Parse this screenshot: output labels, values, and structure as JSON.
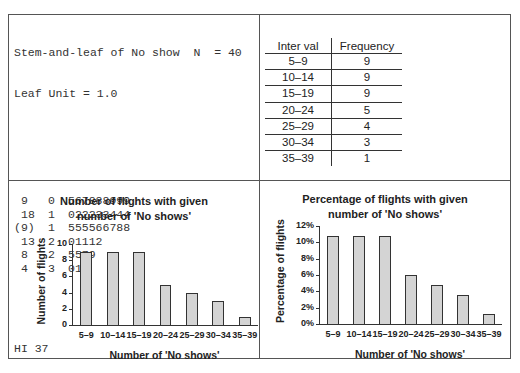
{
  "stem_and_leaf": {
    "header": "Stem-and-leaf of No show  N  = 40",
    "leaf_unit": "Leaf Unit = 1.0",
    "rows": [
      {
        "depth": "9",
        "stem": "0",
        "leaves": "567888999"
      },
      {
        "depth": "18",
        "stem": "1",
        "leaves": "022233444"
      },
      {
        "depth": "(9)",
        "stem": "1",
        "leaves": "555566788"
      },
      {
        "depth": "13",
        "stem": "2",
        "leaves": "01112"
      },
      {
        "depth": "8",
        "stem": "2",
        "leaves": "5579"
      },
      {
        "depth": "4",
        "stem": "3",
        "leaves": "014"
      }
    ],
    "hi": "HI 37"
  },
  "frequency_table": {
    "headers": [
      "Inter val",
      "Frequency"
    ],
    "rows": [
      [
        "5–9",
        "9"
      ],
      [
        "10–14",
        "9"
      ],
      [
        "15–19",
        "9"
      ],
      [
        "20–24",
        "5"
      ],
      [
        "25–29",
        "4"
      ],
      [
        "30–34",
        "3"
      ],
      [
        "35–39",
        "1"
      ]
    ]
  },
  "chart_data": [
    {
      "type": "bar",
      "title": "Number of flights with given number of 'No shows'",
      "title_lines": [
        "Number of flights with given",
        "number of 'No shows'"
      ],
      "categories": [
        "5–9",
        "10–14",
        "15–19",
        "20–24",
        "25–29",
        "30–34",
        "35–39"
      ],
      "values": [
        9,
        9,
        9,
        5,
        4,
        3,
        1
      ],
      "xlabel": "Number of 'No shows'",
      "ylabel": "Number of flights",
      "ylim": [
        0,
        10
      ],
      "yticks": [
        "0",
        "2",
        "4",
        "6",
        "8",
        "10"
      ],
      "grid": false,
      "bar_color": "#d4d4d4"
    },
    {
      "type": "bar",
      "title": "Percentage of flights with given number of 'No shows'",
      "title_lines": [
        "Percentage of flights with given",
        "number of 'No shows'"
      ],
      "categories": [
        "5–9",
        "10–14",
        "15–19",
        "20–24",
        "25–29",
        "30–34",
        "35–39"
      ],
      "values": [
        10.8,
        10.8,
        10.8,
        6.0,
        4.8,
        3.6,
        1.2
      ],
      "xlabel": "Number of 'No shows'",
      "ylabel": "Percentage of flights",
      "ylim": [
        0,
        12
      ],
      "yticks": [
        "0%",
        "2%",
        "4%",
        "6%",
        "8%",
        "10%",
        "12%"
      ],
      "grid": false,
      "bar_color": "#d4d4d4"
    }
  ]
}
